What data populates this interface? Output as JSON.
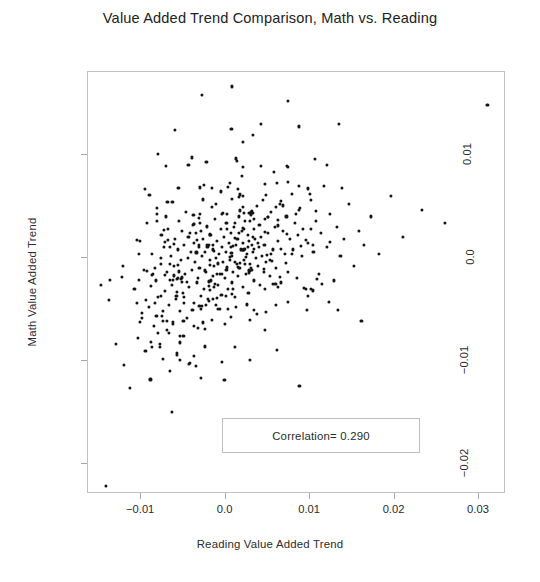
{
  "chart_data": {
    "type": "scatter",
    "title": "Value Added Trend Comparison, Math vs. Reading",
    "xlabel": "Reading Value Added Trend",
    "ylabel": "Math Value Added Trend",
    "xlim": [
      -0.0163,
      0.0332
    ],
    "ylim": [
      -0.0229,
      0.018
    ],
    "xticks": [
      -0.01,
      0.0,
      0.01,
      0.02,
      0.03
    ],
    "xticklabels": [
      "-0.01",
      "0.0",
      "0.01",
      "0.02",
      "0.03"
    ],
    "yticks": [
      0.01,
      0.0,
      -0.01,
      -0.02
    ],
    "yticklabels": [
      "0.01",
      "0.0",
      "-0.01",
      "-0.02"
    ],
    "grid": false,
    "legend": null,
    "marker": {
      "shape": "circle",
      "color": "#151515",
      "size_px": 3
    },
    "annotations": [
      {
        "name": "correlation-box",
        "text": "Correlation= 0.290",
        "box": true,
        "x_range": [
          0.0,
          0.0234
        ],
        "y_range": [
          -0.02,
          -0.016
        ]
      }
    ],
    "n_points": 452,
    "correlation": 0.29,
    "points": [
      [
        -0.0142,
        -0.0221
      ],
      [
        -0.0138,
        -0.0041
      ],
      [
        -0.012,
        -0.0104
      ],
      [
        -0.0113,
        -0.0126
      ],
      [
        -0.0108,
        -0.003
      ],
      [
        -0.0104,
        -0.0078
      ],
      [
        -0.0101,
        0.0016
      ],
      [
        -0.0099,
        -0.0058
      ],
      [
        -0.0097,
        -0.0012
      ],
      [
        -0.0095,
        -0.009
      ],
      [
        -0.0093,
        0.0034
      ],
      [
        -0.0091,
        -0.0048
      ],
      [
        -0.0089,
        -0.0118
      ],
      [
        -0.0087,
        0.0004
      ],
      [
        -0.0085,
        -0.0066
      ],
      [
        -0.0083,
        -0.0022
      ],
      [
        -0.0081,
        0.0048
      ],
      [
        -0.008,
        -0.0038
      ],
      [
        -0.0078,
        -0.0084
      ],
      [
        -0.0077,
        -0.0006
      ],
      [
        -0.0076,
        0.0022
      ],
      [
        -0.0075,
        -0.0056
      ],
      [
        -0.0074,
        -0.0098
      ],
      [
        -0.0073,
        0.001
      ],
      [
        -0.0072,
        -0.0032
      ],
      [
        -0.0071,
        0.004
      ],
      [
        -0.007,
        -0.007
      ],
      [
        -0.0069,
        -0.0014
      ],
      [
        -0.0068,
        0.0028
      ],
      [
        -0.0067,
        -0.0046
      ],
      [
        -0.0066,
        -0.011
      ],
      [
        -0.0065,
        0.0002
      ],
      [
        -0.0064,
        -0.0026
      ],
      [
        -0.0063,
        0.0054
      ],
      [
        -0.0062,
        -0.0062
      ],
      [
        -0.0061,
        -0.0008
      ],
      [
        -0.006,
        0.0018
      ],
      [
        -0.0059,
        -0.004
      ],
      [
        -0.0058,
        -0.0092
      ],
      [
        -0.0057,
        0.0008
      ],
      [
        -0.0056,
        -0.002
      ],
      [
        -0.0055,
        0.0036
      ],
      [
        -0.0054,
        -0.0052
      ],
      [
        -0.0053,
        -0.0002
      ],
      [
        -0.0052,
        0.0026
      ],
      [
        -0.0051,
        -0.0034
      ],
      [
        -0.005,
        -0.0076
      ],
      [
        -0.0049,
        0.0012
      ],
      [
        -0.0048,
        -0.0016
      ],
      [
        -0.0047,
        0.0044
      ],
      [
        -0.0046,
        -0.0058
      ],
      [
        -0.0045,
        0.0
      ],
      [
        -0.0044,
        0.002
      ],
      [
        -0.0043,
        -0.0028
      ],
      [
        -0.0042,
        -0.0102
      ],
      [
        -0.0041,
        0.0006
      ],
      [
        -0.004,
        -0.0012
      ],
      [
        -0.0039,
        0.0032
      ],
      [
        -0.0038,
        -0.0044
      ],
      [
        -0.0037,
        0.0014
      ],
      [
        -0.0036,
        -0.0004
      ],
      [
        -0.0035,
        0.0024
      ],
      [
        -0.0034,
        -0.0024
      ],
      [
        -0.0033,
        -0.0068
      ],
      [
        -0.0032,
        0.001
      ],
      [
        -0.0031,
        -0.001
      ],
      [
        -0.003,
        0.0042
      ],
      [
        -0.0029,
        -0.005
      ],
      [
        -0.0028,
        0.0002
      ],
      [
        -0.0027,
        0.0018
      ],
      [
        -0.0026,
        -0.003
      ],
      [
        -0.0025,
        -0.0086
      ],
      [
        -0.0024,
        0.0006
      ],
      [
        -0.0023,
        -0.0014
      ],
      [
        -0.0022,
        0.003
      ],
      [
        -0.0021,
        -0.004
      ],
      [
        -0.002,
        0.0012
      ],
      [
        -0.0019,
        -0.0002
      ],
      [
        -0.0018,
        0.0022
      ],
      [
        -0.0017,
        -0.0022
      ],
      [
        -0.0016,
        -0.006
      ],
      [
        -0.0015,
        0.0008
      ],
      [
        -0.0014,
        -0.0008
      ],
      [
        -0.0013,
        0.0038
      ],
      [
        -0.0012,
        -0.0046
      ],
      [
        -0.0011,
        0.0
      ],
      [
        -0.001,
        0.0016
      ],
      [
        -0.0009,
        -0.0026
      ],
      [
        -0.0008,
        0.0004
      ],
      [
        -0.0007,
        -0.0016
      ],
      [
        -0.0006,
        0.0028
      ],
      [
        -0.0005,
        -0.0036
      ],
      [
        -0.0004,
        0.001
      ],
      [
        -0.0003,
        -0.0004
      ],
      [
        -0.0002,
        0.002
      ],
      [
        -0.0001,
        -0.002
      ],
      [
        0.0,
        0.0006
      ],
      [
        0.0001,
        -0.0012
      ],
      [
        0.0002,
        0.0034
      ],
      [
        0.0003,
        -0.003
      ],
      [
        0.0004,
        0.0014
      ],
      [
        0.0005,
        -0.0002
      ],
      [
        0.0006,
        0.0024
      ],
      [
        0.0007,
        -0.0024
      ],
      [
        0.0008,
        0.0002
      ],
      [
        0.0009,
        -0.0014
      ],
      [
        0.001,
        0.003
      ],
      [
        0.0011,
        -0.0038
      ],
      [
        0.0012,
        0.0012
      ],
      [
        0.0013,
        -0.0006
      ],
      [
        0.0014,
        0.0018
      ],
      [
        0.0015,
        -0.0018
      ],
      [
        0.0016,
        0.004
      ],
      [
        0.0017,
        -0.001
      ],
      [
        0.0018,
        0.0008
      ],
      [
        0.0019,
        0.0026
      ],
      [
        0.002,
        -0.0028
      ],
      [
        0.0021,
        0.0014
      ],
      [
        0.0022,
        -0.0002
      ],
      [
        0.0023,
        0.0036
      ],
      [
        0.0024,
        -0.0016
      ],
      [
        0.0025,
        0.0004
      ],
      [
        0.0026,
        0.0022
      ],
      [
        0.0027,
        -0.0034
      ],
      [
        0.0028,
        0.0016
      ],
      [
        0.0029,
        -0.0006
      ],
      [
        0.003,
        0.0044
      ],
      [
        0.0031,
        -0.0012
      ],
      [
        0.0032,
        0.0006
      ],
      [
        0.0033,
        0.0028
      ],
      [
        0.0034,
        -0.0022
      ],
      [
        0.0035,
        0.0018
      ],
      [
        0.0036,
        0.0
      ],
      [
        0.0037,
        0.005
      ],
      [
        0.0038,
        -0.0008
      ],
      [
        0.0039,
        0.001
      ],
      [
        0.004,
        0.0032
      ],
      [
        0.0041,
        -0.0026
      ],
      [
        0.0042,
        0.002
      ],
      [
        0.0043,
        0.0002
      ],
      [
        0.0044,
        0.0056
      ],
      [
        0.0045,
        -0.0014
      ],
      [
        0.0046,
        0.0012
      ],
      [
        0.0047,
        0.0038
      ],
      [
        0.0048,
        -0.0004
      ],
      [
        0.005,
        0.0024
      ],
      [
        0.0052,
        -0.0018
      ],
      [
        0.0054,
        0.0044
      ],
      [
        0.0056,
        0.0008
      ],
      [
        0.0058,
        0.003
      ],
      [
        0.006,
        -0.001
      ],
      [
        0.0062,
        0.0016
      ],
      [
        0.0064,
        0.0052
      ],
      [
        0.0066,
        -0.0024
      ],
      [
        0.0068,
        0.0026
      ],
      [
        0.007,
        0.0004
      ],
      [
        0.0072,
        0.004
      ],
      [
        0.0074,
        -0.0014
      ],
      [
        0.0076,
        0.0018
      ],
      [
        0.0078,
        0.0062
      ],
      [
        0.008,
        0.0008
      ],
      [
        0.0082,
        0.0034
      ],
      [
        0.0084,
        -0.002
      ],
      [
        0.0086,
        0.0022
      ],
      [
        0.0088,
        0.0048
      ],
      [
        0.009,
        0.0002
      ],
      [
        0.0092,
        0.0028
      ],
      [
        0.0095,
        -0.003
      ],
      [
        0.0098,
        0.0014
      ],
      [
        0.0101,
        0.0056
      ],
      [
        0.0104,
        0.0006
      ],
      [
        0.0107,
        0.0036
      ],
      [
        0.011,
        -0.0016
      ],
      [
        0.0113,
        0.0024
      ],
      [
        0.0116,
        0.007
      ],
      [
        0.012,
        0.001
      ],
      [
        0.0124,
        0.0042
      ],
      [
        0.0128,
        -0.0022
      ],
      [
        0.0132,
        0.003
      ],
      [
        0.0136,
        0.0002
      ],
      [
        0.014,
        0.0018
      ],
      [
        0.0146,
        0.0052
      ],
      [
        0.0152,
        -0.0008
      ],
      [
        0.0158,
        0.0026
      ],
      [
        0.0164,
        0.0012
      ],
      [
        0.0172,
        0.004
      ],
      [
        0.0182,
        0.0004
      ],
      [
        0.0196,
        0.006
      ],
      [
        0.021,
        0.002
      ],
      [
        0.0232,
        0.0046
      ],
      [
        0.026,
        0.0034
      ],
      [
        0.031,
        0.0148
      ],
      [
        -0.006,
        0.0124
      ],
      [
        -0.0028,
        0.0158
      ],
      [
        0.0008,
        0.0166
      ],
      [
        0.0042,
        0.013
      ],
      [
        0.0074,
        0.0152
      ],
      [
        0.0106,
        0.0096
      ],
      [
        0.002,
        0.0112
      ],
      [
        -0.0044,
        0.009
      ]
    ]
  },
  "axes": {
    "x_tick_labels": [
      "-0.01",
      "0.0",
      "0.01",
      "0.02",
      "0.03"
    ],
    "y_tick_labels": [
      "0.01",
      "0.0",
      "-0.01",
      "-0.02"
    ],
    "x_title": "Reading Value Added Trend",
    "y_title": "Math Value Added Trend"
  },
  "annotation": {
    "correlation_label": "Correlation= 0.290"
  },
  "title": {
    "text": "Value Added Trend Comparison, Math vs. Reading"
  },
  "colors": {
    "marker": "#151515",
    "frame": "#c2c2c2",
    "text": "#2b2b2b",
    "background": "#ffffff"
  }
}
